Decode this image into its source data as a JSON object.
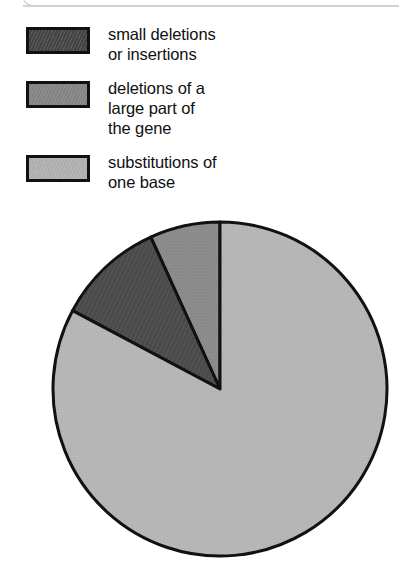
{
  "panel": {
    "top_edge_name": "rounded-panel-bottom-edge"
  },
  "legend": {
    "items": [
      {
        "label": "small deletions\nor insertions",
        "swatch_name": "legend-swatch-small-deletions",
        "color": "#4a4a4a",
        "pattern": "diagonal-hatch"
      },
      {
        "label": "deletions of a\nlarge part of\nthe gene",
        "swatch_name": "legend-swatch-large-deletions",
        "color": "#8a8a8a",
        "pattern": "solid"
      },
      {
        "label": "substitutions of\none base",
        "swatch_name": "legend-swatch-substitutions",
        "color": "#b5b5b5",
        "pattern": "solid"
      }
    ]
  },
  "chart_data": {
    "type": "pie",
    "title": "",
    "xlabel": "",
    "ylabel": "",
    "categories": [
      "deletions of a large part of the gene",
      "small deletions or insertions",
      "substitutions of one base"
    ],
    "values": [
      6.8,
      10.4,
      82.8
    ],
    "colors": [
      "#8a8a8a",
      "#4a4a4a",
      "#b5b5b5"
    ],
    "units": "percent",
    "start_angle_deg": 90,
    "direction": "counterclockwise",
    "legend_position": "top",
    "grid": false,
    "geometry": {
      "center_x": 220,
      "center_y": 389,
      "radius": 167,
      "stroke": "#111111",
      "stroke_width": 3
    },
    "slice_boundaries_deg_ccw_from_top": [
      0,
      24.5,
      62,
      360
    ]
  }
}
